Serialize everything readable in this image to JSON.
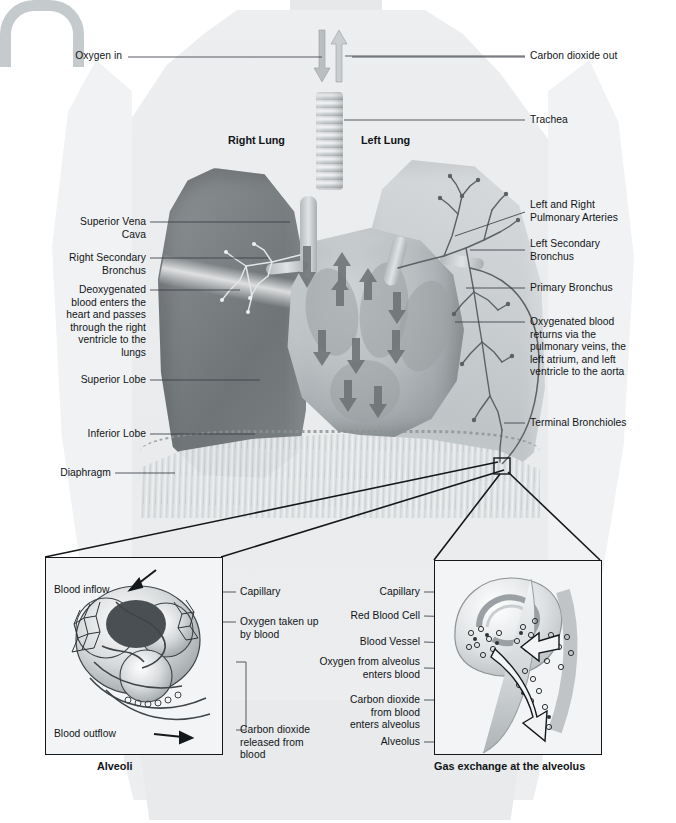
{
  "diagram": {
    "colors": {
      "background": "#ffffff",
      "body_silhouette": "#eceeef",
      "right_lung": "#7e8386",
      "left_lung": "#cbcfd2",
      "heart": "#b9bec1",
      "line": "#3a3f44",
      "text": "#111418",
      "inset_fill": "#f3f4f5",
      "inset_border": "#15181b"
    }
  },
  "flow_labels": {
    "oxygen_in": "Oxygen in",
    "carbon_dioxide_out": "Carbon dioxide out"
  },
  "organ_labels": {
    "right_lung": "Right Lung",
    "left_lung": "Left Lung"
  },
  "left_labels": [
    {
      "id": "superior-vena-cava",
      "text": "Superior Vena\nCava"
    },
    {
      "id": "right-secondary-bronchus",
      "text": "Right Secondary\nBronchus"
    },
    {
      "id": "deoxygenated-blood",
      "text": "Deoxygenated\nblood enters the\nheart and passes\nthrough the right\nventricle to the\nlungs"
    },
    {
      "id": "superior-lobe",
      "text": "Superior Lobe"
    },
    {
      "id": "inferior-lobe",
      "text": "Inferior Lobe"
    },
    {
      "id": "diaphragm",
      "text": "Diaphragm"
    }
  ],
  "right_labels": [
    {
      "id": "trachea",
      "text": "Trachea"
    },
    {
      "id": "pulmonary-arteries",
      "text": "Left and Right\nPulmonary Arteries"
    },
    {
      "id": "left-secondary-bronchus",
      "text": "Left Secondary\nBronchus"
    },
    {
      "id": "primary-bronchus",
      "text": "Primary Bronchus"
    },
    {
      "id": "oxygenated-blood",
      "text": "Oxygenated blood\nreturns via the\npulmonary veins, the\nleft atrium, and left\nventricle to the aorta"
    },
    {
      "id": "terminal-bronchioles",
      "text": "Terminal Bronchioles"
    }
  ],
  "inset_left": {
    "caption": "Alveoli",
    "inflow": "Blood inflow",
    "outflow": "Blood outflow",
    "labels": [
      {
        "id": "capillary",
        "text": "Capillary"
      },
      {
        "id": "oxygen-taken-up",
        "text": "Oxygen taken up\nby blood"
      },
      {
        "id": "carbon-dioxide-released",
        "text": "Carbon dioxide\nreleased from\nblood"
      }
    ]
  },
  "inset_right": {
    "caption": "Gas exchange at the alveolus",
    "labels": [
      {
        "id": "capillary",
        "text": "Capillary"
      },
      {
        "id": "red-blood-cell",
        "text": "Red Blood Cell"
      },
      {
        "id": "blood-vessel",
        "text": "Blood Vessel"
      },
      {
        "id": "oxygen-enters-blood",
        "text": "Oxygen from alveolus\nenters blood"
      },
      {
        "id": "carbon-dioxide-enters-alveolus",
        "text": "Carbon dioxide\nfrom blood\nenters alveolus"
      },
      {
        "id": "alveolus",
        "text": "Alveolus"
      }
    ]
  }
}
